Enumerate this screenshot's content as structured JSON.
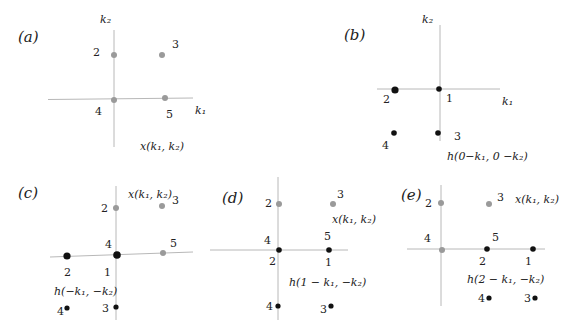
{
  "figure": {
    "axis_color": "#b8b8b8",
    "x_point_color": "#9a9a9a",
    "h_point_color": "#111111",
    "panels": [
      {
        "id": "a",
        "label": "(a)",
        "axis_labels": {
          "x": "k₁",
          "y": "k₂"
        },
        "caption": "x(k₁, k₂)",
        "point_labels": [
          "2",
          "3",
          "4",
          "5"
        ]
      },
      {
        "id": "b",
        "label": "(b)",
        "axis_labels": {
          "x": "k₁",
          "y": "k₂"
        },
        "caption": "h(0−k₁, 0 −k₂)",
        "point_labels": [
          "2",
          "1",
          "4",
          "3"
        ]
      },
      {
        "id": "c",
        "label": "(c)",
        "x_caption": "x(k₁, k₂)",
        "h_caption": "h(−k₁, −k₂)",
        "x_point_labels": [
          "2",
          "3",
          "4",
          "5"
        ],
        "h_point_labels": [
          "2",
          "1",
          "4",
          "3"
        ]
      },
      {
        "id": "d",
        "label": "(d)",
        "x_caption": "x(k₁, k₂)",
        "h_caption": "h(1 − k₁, −k₂)",
        "x_point_labels": [
          "2",
          "3",
          "4",
          "5"
        ],
        "h_point_labels": [
          "2",
          "1",
          "4",
          "3"
        ]
      },
      {
        "id": "e",
        "label": "(e)",
        "x_caption": "x(k₁, k₂)",
        "h_caption": "h(2 − k₁, −k₂)",
        "x_point_labels": [
          "2",
          "3",
          "4",
          "5"
        ],
        "h_point_labels": [
          "2",
          "1",
          "4",
          "3"
        ]
      }
    ]
  }
}
